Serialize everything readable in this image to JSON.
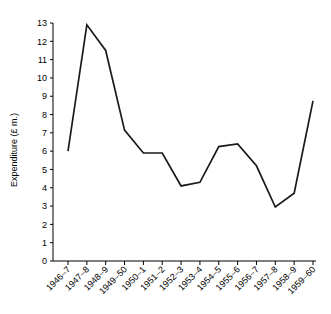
{
  "chart_data": {
    "type": "line",
    "title": "",
    "xlabel": "",
    "ylabel": "Expenditure (£ m.)",
    "categories": [
      "1946–7",
      "1947–8",
      "1948–9",
      "1949–50",
      "1950–1",
      "1951–2",
      "1952–3",
      "1953–4",
      "1954–5",
      "1955–6",
      "1956–7",
      "1957–8",
      "1958–9",
      "1959–60"
    ],
    "values": [
      6.0,
      12.9,
      11.5,
      7.15,
      5.9,
      5.9,
      4.1,
      4.3,
      6.25,
      6.4,
      5.2,
      2.95,
      3.7,
      8.75
    ],
    "series": [
      {
        "name": "Expenditure",
        "values": [
          6.0,
          12.9,
          11.5,
          7.15,
          5.9,
          5.9,
          4.1,
          4.3,
          6.25,
          6.4,
          5.2,
          2.95,
          3.7,
          8.75
        ]
      }
    ],
    "ylim": [
      0,
      13
    ],
    "ytick_labels": [
      "0",
      "1",
      "2",
      "3",
      "4",
      "5",
      "6",
      "7",
      "8",
      "9",
      "10",
      "11",
      "12",
      "13"
    ],
    "ytick_values": [
      0,
      1,
      2,
      3,
      4,
      5,
      6,
      7,
      8,
      9,
      10,
      11,
      12,
      13
    ],
    "grid": false,
    "legend": false,
    "legend_position": "none",
    "line_color": "#1a1a1a",
    "xtick_rotation": -45
  }
}
